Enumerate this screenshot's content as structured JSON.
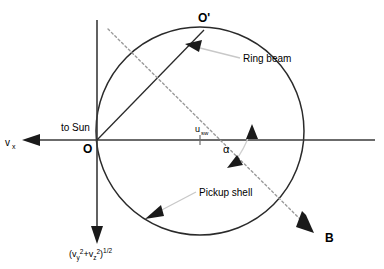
{
  "figure": {
    "type": "velocity-space-schematic",
    "background_color": "#ffffff",
    "line_color": "#2a2a2a",
    "dashed_color": "#9a9a9a",
    "leader_color": "#c8c8c8"
  },
  "axes": {
    "x_axis": {
      "label": "v",
      "subscript": "x",
      "direction_label": "to Sun",
      "arrow_direction": "left"
    },
    "y_axis": {
      "label_open": "(v",
      "sub1": "y",
      "sup1": "2",
      "plus": "+v",
      "sub2": "z",
      "sup2": "2",
      "close": ")",
      "exponent": "1/2",
      "full_label": "(vy2+vz2)1/2",
      "arrow_direction": "down"
    }
  },
  "points": {
    "origin": "O",
    "ring_beam_point": "O'"
  },
  "labels": {
    "ring_beam": "Ring beam",
    "pickup_shell": "Pickup shell",
    "solar_wind_speed": "u",
    "solar_wind_speed_sub": "sw",
    "magnetic_field": "B",
    "angle": "α"
  },
  "geometry": {
    "circle_center_x": 200,
    "circle_center_y": 131,
    "circle_radius": 104,
    "origin_x": 97,
    "origin_y": 140,
    "ring_beam_x": 204,
    "ring_beam_y": 30
  }
}
